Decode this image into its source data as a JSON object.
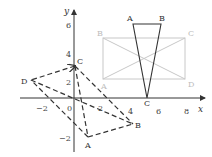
{
  "diagram": {
    "axes": {
      "x_label": "x",
      "y_label": "y",
      "x_ticks": [
        "−2",
        "0",
        "2",
        "4",
        "6",
        "8"
      ],
      "y_ticks": [
        "6",
        "4",
        "2",
        "−2"
      ],
      "color": "#333333"
    },
    "dashed_quad": {
      "labels": {
        "A": "A",
        "B": "B",
        "C": "C",
        "D": "D"
      },
      "color": "#333333",
      "style": "dashed"
    },
    "triangle": {
      "labels": {
        "A": "A",
        "B": "B",
        "C": "C"
      },
      "color": "#333333"
    },
    "gray_rectangle": {
      "labels": {
        "A": "A",
        "B": "B",
        "C": "C",
        "D": "D"
      },
      "color": "#c8c8c8"
    }
  }
}
